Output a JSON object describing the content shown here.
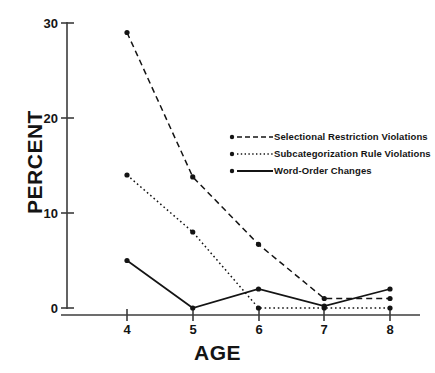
{
  "chart_data": {
    "type": "line",
    "title": "",
    "xlabel": "AGE",
    "ylabel": "PERCENT",
    "x": [
      4,
      5,
      6,
      7,
      8
    ],
    "xtick_labels": [
      "4",
      "5",
      "6",
      "7",
      "8"
    ],
    "ytick_labels": [
      "0",
      "10",
      "20",
      "30"
    ],
    "yticks": [
      0,
      10,
      20,
      30
    ],
    "xlim": [
      3.5,
      8.6
    ],
    "ylim": [
      0,
      30
    ],
    "grid": false,
    "legend_position": "upper-right-inside",
    "series": [
      {
        "name": "Selectional Restriction Violations",
        "style": "dashed",
        "marker": "dot",
        "values": [
          29,
          13.8,
          6.7,
          1,
          1
        ]
      },
      {
        "name": "Subcategorization Rule Violations",
        "style": "dotted",
        "marker": "dot",
        "values": [
          14,
          8,
          0,
          0,
          0
        ]
      },
      {
        "name": "Word-Order Changes",
        "style": "solid",
        "marker": "dot",
        "values": [
          5,
          0,
          2,
          0.2,
          2
        ]
      }
    ]
  },
  "legend": {
    "entries": [
      {
        "label": "Selectional Restriction Violations"
      },
      {
        "label": "Subcategorization Rule Violations"
      },
      {
        "label": "Word-Order Changes"
      }
    ]
  },
  "colors": {
    "ink": "#141414",
    "axis": "#3c3c3c",
    "background": "#ffffff"
  }
}
